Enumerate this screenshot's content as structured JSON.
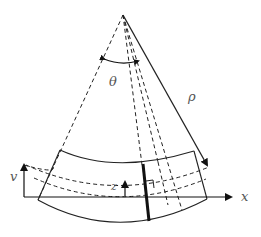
{
  "diagram": {
    "labels": {
      "theta": "θ",
      "rho": "ρ",
      "x_axis": "x",
      "v_axis": "v",
      "z": "z"
    },
    "colors": {
      "stroke": "#222222",
      "label": "#555555",
      "background": "#ffffff"
    }
  }
}
